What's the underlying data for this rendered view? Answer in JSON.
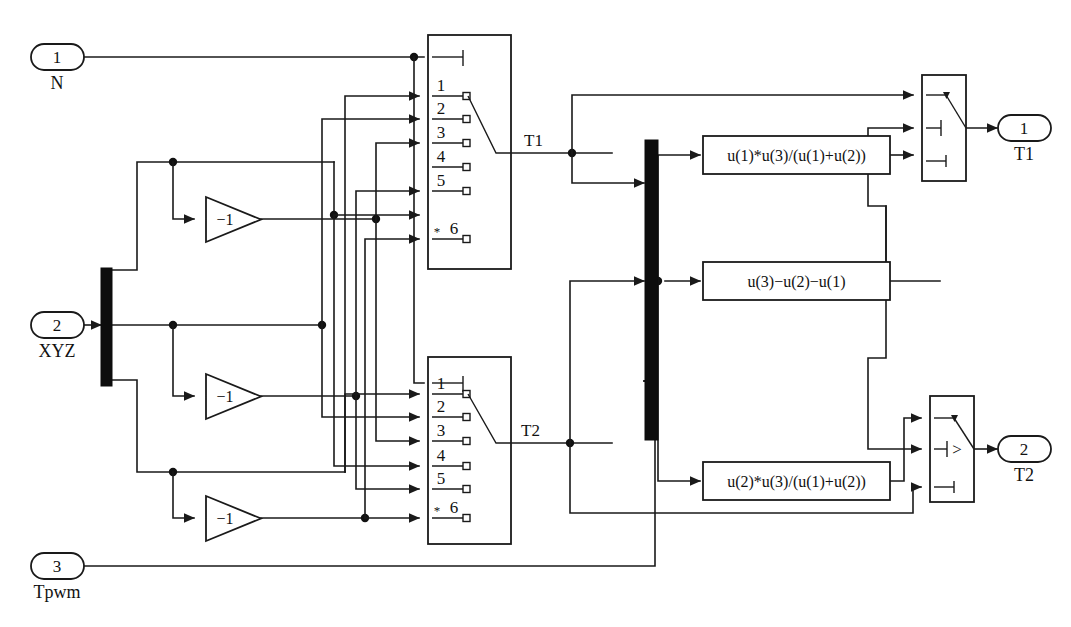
{
  "diagram": {
    "background_color": "#ffffff",
    "line_color": "#1a1a1a",
    "mux_color": "#0d0d0d"
  },
  "inports": [
    {
      "number": "1",
      "label": "N"
    },
    {
      "number": "2",
      "label": "XYZ"
    },
    {
      "number": "3",
      "label": "Tpwm"
    }
  ],
  "outports": [
    {
      "number": "1",
      "label": "T1"
    },
    {
      "number": "2",
      "label": "T2"
    }
  ],
  "gains": [
    {
      "value": "−1"
    },
    {
      "value": "−1"
    },
    {
      "value": "−1"
    }
  ],
  "multiport_switches": [
    {
      "name": "multiport-switch-t1",
      "output_signal": "T1",
      "control_port": "control",
      "data_ports": [
        "1",
        "2",
        "3",
        "4",
        "5",
        "6"
      ],
      "last_port_marker": "*"
    },
    {
      "name": "multiport-switch-t2",
      "output_signal": "T2",
      "control_port": "control",
      "data_ports": [
        "1",
        "2",
        "3",
        "4",
        "5",
        "6"
      ],
      "last_port_marker": "*"
    }
  ],
  "fcn_blocks": [
    {
      "expression": "u(1)*u(3)/(u(1)+u(2))"
    },
    {
      "expression": "u(3)−u(2)−u(1)"
    },
    {
      "expression": "u(2)*u(3)/(u(1)+u(2))"
    }
  ],
  "switches": [
    {
      "name": "switch-t1",
      "criteria": ""
    },
    {
      "name": "switch-t2",
      "criteria": ">"
    }
  ],
  "mux": {
    "inputs": "3",
    "label": ""
  },
  "demux": {
    "outputs": "3",
    "label": ""
  },
  "signal_labels": [
    "T1",
    "T2"
  ]
}
